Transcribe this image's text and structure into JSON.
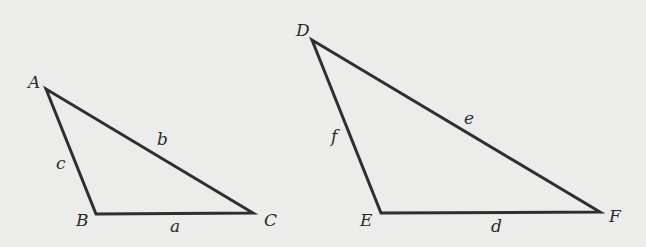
{
  "background": "#ececea",
  "stroke_color": "#2f2f2f",
  "triangles": [
    {
      "name": "ABC",
      "vertices": [
        {
          "label": "A",
          "x": 46,
          "y": 89
        },
        {
          "label": "B",
          "x": 96,
          "y": 214
        },
        {
          "label": "C",
          "x": 253,
          "y": 213
        }
      ],
      "sides": [
        {
          "label": "c",
          "between": "A-B"
        },
        {
          "label": "b",
          "between": "A-C"
        },
        {
          "label": "a",
          "between": "B-C"
        }
      ]
    },
    {
      "name": "DEF",
      "vertices": [
        {
          "label": "D",
          "x": 312,
          "y": 40
        },
        {
          "label": "E",
          "x": 381,
          "y": 213
        },
        {
          "label": "F",
          "x": 600,
          "y": 212
        }
      ],
      "sides": [
        {
          "label": "f",
          "between": "D-E"
        },
        {
          "label": "e",
          "between": "D-F"
        },
        {
          "label": "d",
          "between": "E-F"
        }
      ]
    }
  ]
}
